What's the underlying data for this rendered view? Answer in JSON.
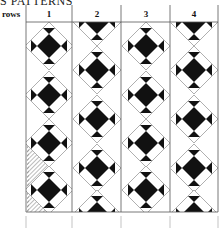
{
  "heading": "S PATTERNS",
  "rows_label": "rows",
  "columns": [
    {
      "label": "1",
      "start": "full"
    },
    {
      "label": "2",
      "start": "half"
    },
    {
      "label": "3",
      "start": "full"
    },
    {
      "label": "4",
      "start": "half"
    }
  ],
  "colors": {
    "ink": "#111111",
    "line": "#9a9a9a",
    "grid": "#555555",
    "hatch": "#777777"
  },
  "block": "eight-pointed star in on-point diamond"
}
